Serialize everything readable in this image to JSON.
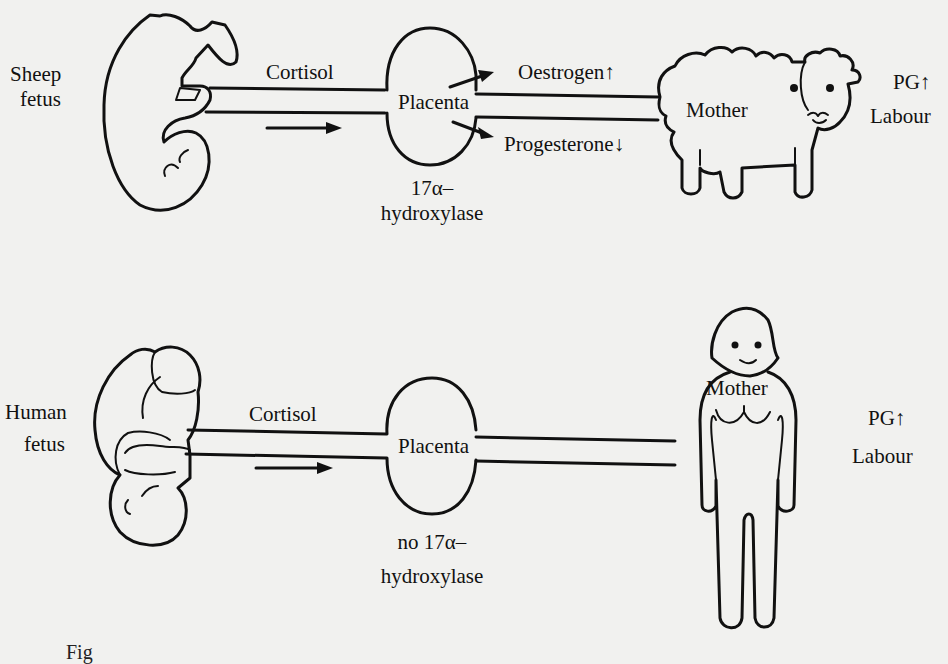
{
  "diagram": {
    "sheep_panel": {
      "fetus_label_line1": "Sheep",
      "fetus_label_line2": "fetus",
      "hormone_from_fetus": "Cortisol",
      "placenta_label": "Placenta",
      "enzyme_line1": "17α–",
      "enzyme_line2": "hydroxylase",
      "oestrogen_label": "Oestrogen",
      "oestrogen_arrow": "↑",
      "progesterone_label": "Progesterone",
      "progesterone_arrow": "↓",
      "mother_label": "Mother",
      "pg_label": "PG",
      "pg_arrow": "↑",
      "outcome_label": "Labour"
    },
    "human_panel": {
      "fetus_label_line1": "Human",
      "fetus_label_line2": "fetus",
      "hormone_from_fetus": "Cortisol",
      "placenta_label": "Placenta",
      "enzyme_line1": "no 17α–",
      "enzyme_line2": "hydroxylase",
      "mother_label": "Mother",
      "pg_label": "PG",
      "pg_arrow": "↑",
      "outcome_label": "Labour"
    },
    "caption_partial": "Fig"
  },
  "colors": {
    "ink": "#111111",
    "paper": "#f1f1ef"
  }
}
